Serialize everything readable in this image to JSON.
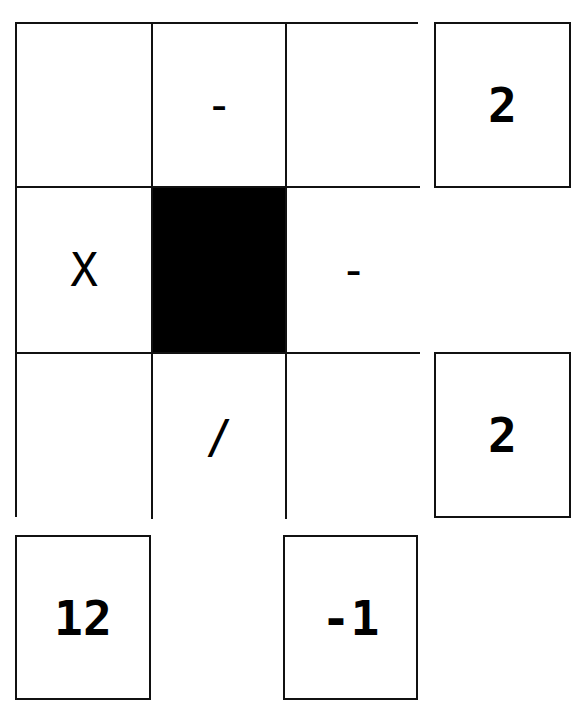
{
  "puzzle": {
    "grid": [
      [
        {
          "value": ""
        },
        {
          "value": "-"
        },
        {
          "value": ""
        }
      ],
      [
        {
          "value": "X"
        },
        {
          "value": "",
          "blocked": true
        },
        {
          "value": "-"
        }
      ],
      [
        {
          "value": ""
        },
        {
          "value": "/"
        },
        {
          "value": ""
        }
      ]
    ],
    "row_results": [
      "2",
      "",
      "2"
    ],
    "column_results": [
      "12",
      "",
      "-1"
    ]
  },
  "colors": {
    "border": "#111111",
    "blocked": "#000000",
    "background": "#ffffff"
  }
}
